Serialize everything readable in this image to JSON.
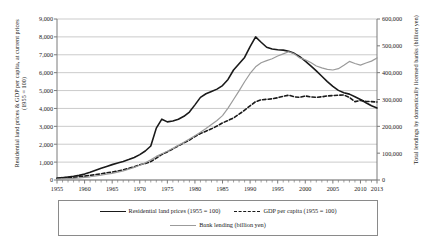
{
  "chart_data": {
    "type": "line",
    "title": "",
    "xlabel": "",
    "ylabel": "Residential land prices & GDP per capita, at current prices (1955 = 100)",
    "y2label": "Total lendings by domestically licensed banks (billion yen)",
    "grid": true,
    "legend_position": "bottom",
    "xlim": [
      1955,
      2013
    ],
    "ylim": [
      0,
      9000
    ],
    "y2lim": [
      0,
      600000
    ],
    "x_ticks": [
      1955,
      1960,
      1965,
      1970,
      1975,
      1980,
      1985,
      1990,
      1995,
      2000,
      2005,
      2010,
      2013
    ],
    "y_ticks": [
      0,
      1000,
      2000,
      3000,
      4000,
      5000,
      6000,
      7000,
      8000,
      9000
    ],
    "y_tick_labels": [
      "0",
      "1,000",
      "2,000",
      "3,000",
      "4,000",
      "5,000",
      "6,000",
      "7,000",
      "8,000",
      "9,000"
    ],
    "y2_ticks": [
      0,
      100000,
      200000,
      300000,
      400000,
      500000,
      600000
    ],
    "y2_tick_labels": [
      "0",
      "100,000",
      "200,000",
      "300,000",
      "400,000",
      "500,000",
      "600,000"
    ],
    "x": [
      1955,
      1956,
      1957,
      1958,
      1959,
      1960,
      1961,
      1962,
      1963,
      1964,
      1965,
      1966,
      1967,
      1968,
      1969,
      1970,
      1971,
      1972,
      1973,
      1974,
      1975,
      1976,
      1977,
      1978,
      1979,
      1980,
      1981,
      1982,
      1983,
      1984,
      1985,
      1986,
      1987,
      1988,
      1989,
      1990,
      1991,
      1992,
      1993,
      1994,
      1995,
      1996,
      1997,
      1998,
      1999,
      2000,
      2001,
      2002,
      2003,
      2004,
      2005,
      2006,
      2007,
      2008,
      2009,
      2010,
      2011,
      2012,
      2013
    ],
    "series": [
      {
        "name": "Residential land prices (1955 = 100)",
        "axis": "left",
        "style": "solid",
        "color": "#1a1a1a",
        "width": 1.6,
        "values": [
          100,
          130,
          170,
          210,
          260,
          330,
          430,
          540,
          650,
          760,
          860,
          950,
          1040,
          1140,
          1260,
          1420,
          1620,
          1900,
          2900,
          3400,
          3250,
          3300,
          3400,
          3560,
          3800,
          4200,
          4620,
          4820,
          4950,
          5080,
          5280,
          5620,
          6150,
          6500,
          6850,
          7450,
          8000,
          7700,
          7420,
          7320,
          7280,
          7260,
          7200,
          7080,
          6900,
          6650,
          6380,
          6100,
          5800,
          5500,
          5230,
          5010,
          4880,
          4800,
          4650,
          4500,
          4320,
          4150,
          4030
        ]
      },
      {
        "name": "GDP per capita (1955 = 100)",
        "axis": "left",
        "style": "dashed",
        "color": "#1a1a1a",
        "width": 1.6,
        "values": [
          100,
          120,
          140,
          155,
          180,
          215,
          260,
          300,
          345,
          400,
          440,
          500,
          570,
          650,
          740,
          850,
          920,
          1030,
          1220,
          1430,
          1570,
          1740,
          1910,
          2070,
          2230,
          2430,
          2600,
          2730,
          2860,
          3020,
          3190,
          3330,
          3470,
          3680,
          3900,
          4150,
          4380,
          4480,
          4510,
          4540,
          4600,
          4680,
          4740,
          4650,
          4620,
          4700,
          4640,
          4620,
          4650,
          4700,
          4720,
          4740,
          4750,
          4620,
          4380,
          4450,
          4400,
          4380,
          4360
        ]
      },
      {
        "name": "Bank lending (billion yen)",
        "axis": "right",
        "style": "solid",
        "color": "#9b9b9b",
        "width": 1.2,
        "values": [
          3000,
          4000,
          5000,
          6000,
          7500,
          9500,
          12000,
          15000,
          18000,
          21500,
          25000,
          29000,
          34000,
          40000,
          47000,
          55000,
          64000,
          75000,
          88000,
          98000,
          107000,
          118000,
          129000,
          141000,
          153000,
          165000,
          178000,
          192000,
          207000,
          222000,
          240000,
          268000,
          300000,
          332000,
          366000,
          397000,
          422000,
          437000,
          445000,
          452000,
          462000,
          470000,
          478000,
          470000,
          455000,
          448000,
          438000,
          425000,
          418000,
          412000,
          410000,
          415000,
          428000,
          442000,
          434000,
          428000,
          436000,
          443000,
          455000
        ]
      }
    ]
  },
  "legend": {
    "items": [
      {
        "label": "Residential land prices (1955 = 100)",
        "swatch": "solid-dark"
      },
      {
        "label": "GDP per capita (1955 = 100)",
        "swatch": "dashed"
      },
      {
        "label": "Bank lending (billion yen)",
        "swatch": "solid-gray"
      }
    ]
  },
  "colors": {
    "land_prices": "#1a1a1a",
    "gdp_per_capita": "#1a1a1a",
    "bank_lending": "#9b9b9b",
    "gridline": "#b5b5b5",
    "axis": "#7a7a7a",
    "legend_border": "#8a8a8a"
  }
}
